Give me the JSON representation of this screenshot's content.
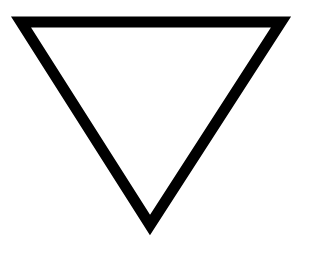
{
  "figure": {
    "shape": "inverted-triangle",
    "description": "Downward-pointing triangle outline",
    "stroke_color": "#000000",
    "fill_color": "#ffffff",
    "background_color": "#ffffff",
    "stroke_width": 11,
    "vertices": {
      "top_left": [
        21,
        22
      ],
      "top_right": [
        281,
        22
      ],
      "apex": [
        150,
        225
      ]
    }
  }
}
